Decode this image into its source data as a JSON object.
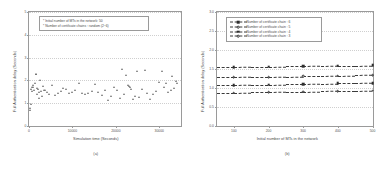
{
  "figure": {
    "panel_a": {
      "caption": "(a)",
      "axis": {
        "xlabel": "Simulation time (Seconds)",
        "ylabel": "Full Authentication delay (Seconds)",
        "xticks": [
          "0",
          "10000",
          "20000",
          "30000"
        ],
        "yticks": [
          "5",
          "4",
          "3",
          "2",
          "1",
          "0"
        ]
      },
      "annotation": {
        "line1": "* Initial number of MTs in the network: 50",
        "line2": "* Number of certificate chains : random (2~6)"
      }
    },
    "panel_b": {
      "caption": "(b)",
      "axis": {
        "xlabel": "Initial number of MTs in the network",
        "ylabel": "Full Authentication delay (Seconds)",
        "xticks": [
          "100",
          "200",
          "300",
          "400",
          "500"
        ],
        "yticks": [
          "3.0",
          "2.5",
          "2.0",
          "1.5",
          "1.0",
          "0.5",
          "0.0"
        ]
      },
      "legend": [
        {
          "label": "Number of certificate chain : 6",
          "marker": "mk-sq-f"
        },
        {
          "label": "Number of certificate chain : 5",
          "marker": "mk-ci-o"
        },
        {
          "label": "Number of certificate chain : 4",
          "marker": "mk-sq-f"
        },
        {
          "label": "Number of certificate chain : 3",
          "marker": "mk-ci-o"
        }
      ]
    }
  },
  "chart_data": [
    {
      "type": "scatter",
      "panel": "(a)",
      "title": "",
      "xlabel": "Simulation time (Seconds)",
      "ylabel": "Full Authentication delay (Seconds)",
      "xlim": [
        0,
        35000
      ],
      "ylim": [
        0,
        5
      ],
      "xticks": [
        0,
        10000,
        20000,
        30000
      ],
      "yticks": [
        0,
        1,
        2,
        3,
        4,
        5
      ],
      "grid": true,
      "legend": null,
      "marker": "triangle",
      "annotations": [
        "* Initial number of MTs in the network: 50",
        "* Number of certificate chains : random (2~6)"
      ],
      "points": [
        [
          250,
          0.78
        ],
        [
          300,
          0.72
        ],
        [
          380,
          0.95
        ],
        [
          520,
          1.62
        ],
        [
          640,
          1.7
        ],
        [
          700,
          1.55
        ],
        [
          820,
          1.8
        ],
        [
          980,
          1.72
        ],
        [
          1150,
          1.58
        ],
        [
          1300,
          1.9
        ],
        [
          1500,
          2.28
        ],
        [
          1620,
          2.3
        ],
        [
          1750,
          1.68
        ],
        [
          1900,
          1.4
        ],
        [
          2050,
          1.62
        ],
        [
          2250,
          1.25
        ],
        [
          2400,
          1.48
        ],
        [
          2600,
          2.02
        ],
        [
          2750,
          1.52
        ],
        [
          2950,
          1.3
        ],
        [
          3150,
          1.74
        ],
        [
          3400,
          1.58
        ],
        [
          3700,
          1.6
        ],
        [
          4100,
          1.5
        ],
        [
          4500,
          1.42
        ],
        [
          5200,
          1.78
        ],
        [
          5900,
          1.38
        ],
        [
          6600,
          1.45
        ],
        [
          7300,
          1.52
        ],
        [
          7900,
          1.68
        ],
        [
          8600,
          1.62
        ],
        [
          9200,
          1.44
        ],
        [
          9900,
          1.5
        ],
        [
          10600,
          1.58
        ],
        [
          11400,
          1.9
        ],
        [
          12100,
          1.46
        ],
        [
          12900,
          1.4
        ],
        [
          13600,
          1.44
        ],
        [
          14400,
          1.52
        ],
        [
          15200,
          1.86
        ],
        [
          15900,
          1.48
        ],
        [
          16700,
          1.35
        ],
        [
          17400,
          1.58
        ],
        [
          18200,
          1.12
        ],
        [
          18900,
          1.3
        ],
        [
          19600,
          1.7
        ],
        [
          20300,
          1.6
        ],
        [
          20900,
          1.22
        ],
        [
          21400,
          2.52
        ],
        [
          21900,
          1.42
        ],
        [
          22300,
          2.22
        ],
        [
          22700,
          1.8
        ],
        [
          23000,
          1.76
        ],
        [
          23300,
          1.7
        ],
        [
          23600,
          1.64
        ],
        [
          23900,
          1.2
        ],
        [
          24300,
          1.32
        ],
        [
          24800,
          2.42
        ],
        [
          25400,
          1.28
        ],
        [
          26000,
          1.62
        ],
        [
          26600,
          2.44
        ],
        [
          27200,
          1.46
        ],
        [
          27900,
          1.18
        ],
        [
          28600,
          1.4
        ],
        [
          29300,
          1.52
        ],
        [
          30000,
          1.92
        ],
        [
          30600,
          2.4
        ],
        [
          31100,
          1.72
        ],
        [
          31600,
          1.88
        ],
        [
          32100,
          1.5
        ],
        [
          32600,
          1.6
        ],
        [
          33000,
          2.18
        ],
        [
          33400,
          1.66
        ],
        [
          33800,
          1.96
        ],
        [
          34100,
          1.9
        ]
      ]
    },
    {
      "type": "line",
      "panel": "(b)",
      "title": "",
      "xlabel": "Initial number of MTs in the network",
      "ylabel": "Full Authentication delay (Seconds)",
      "xlim": [
        50,
        500
      ],
      "ylim": [
        0.0,
        3.0
      ],
      "xticks": [
        100,
        200,
        300,
        400,
        500
      ],
      "yticks": [
        0.0,
        0.5,
        1.0,
        1.5,
        2.0,
        2.5,
        3.0
      ],
      "grid": true,
      "legend_position": "upper-left",
      "x": [
        50,
        100,
        150,
        200,
        250,
        300,
        350,
        400,
        450,
        500
      ],
      "series": [
        {
          "name": "Number of certificate chain : 6",
          "values": [
            1.55,
            1.55,
            1.56,
            1.56,
            1.57,
            1.57,
            1.58,
            1.59,
            1.59,
            1.6
          ]
        },
        {
          "name": "Number of certificate chain : 5",
          "values": [
            1.28,
            1.28,
            1.29,
            1.29,
            1.3,
            1.31,
            1.31,
            1.32,
            1.33,
            1.34
          ]
        },
        {
          "name": "Number of certificate chain : 4",
          "values": [
            1.08,
            1.08,
            1.09,
            1.09,
            1.1,
            1.1,
            1.11,
            1.12,
            1.12,
            1.13
          ]
        },
        {
          "name": "Number of certificate chain : 3",
          "values": [
            0.88,
            0.88,
            0.89,
            0.89,
            0.9,
            0.9,
            0.91,
            0.92,
            0.92,
            0.93
          ]
        }
      ]
    }
  ]
}
